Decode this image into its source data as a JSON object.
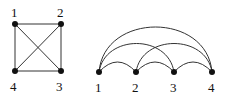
{
  "diagrams": [
    {
      "name": "complete-graph-K4-square",
      "nodes": [
        {
          "id": "1",
          "label": "1"
        },
        {
          "id": "2",
          "label": "2"
        },
        {
          "id": "3",
          "label": "3"
        },
        {
          "id": "4",
          "label": "4"
        }
      ],
      "edges": [
        [
          "1",
          "2"
        ],
        [
          "2",
          "3"
        ],
        [
          "3",
          "4"
        ],
        [
          "4",
          "1"
        ],
        [
          "1",
          "3"
        ],
        [
          "2",
          "4"
        ]
      ]
    },
    {
      "name": "complete-graph-K4-arc-diagram",
      "nodes": [
        {
          "id": "1",
          "label": "1"
        },
        {
          "id": "2",
          "label": "2"
        },
        {
          "id": "3",
          "label": "3"
        },
        {
          "id": "4",
          "label": "4"
        }
      ],
      "edges": [
        [
          "1",
          "2"
        ],
        [
          "2",
          "3"
        ],
        [
          "3",
          "4"
        ],
        [
          "1",
          "3"
        ],
        [
          "2",
          "4"
        ],
        [
          "1",
          "4"
        ]
      ]
    }
  ]
}
